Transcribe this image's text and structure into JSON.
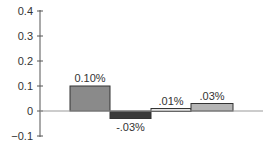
{
  "chart_data": {
    "type": "bar",
    "categories": [
      "1",
      "2",
      "3",
      "4"
    ],
    "values": [
      0.1,
      -0.03,
      0.01,
      0.03
    ],
    "labels": [
      "0.10%",
      "-.03%",
      ".01%",
      ".03%"
    ],
    "colors": [
      "#8a8a8a",
      "#3a3a3a",
      "#e6e6e6",
      "#b5b5b5"
    ],
    "yticks": [
      "0.4",
      "0.3",
      "0.2",
      "0.1",
      "0",
      "−0.1"
    ],
    "ylim": [
      -0.1,
      0.4
    ],
    "title": "",
    "xlabel": "",
    "ylabel": ""
  }
}
